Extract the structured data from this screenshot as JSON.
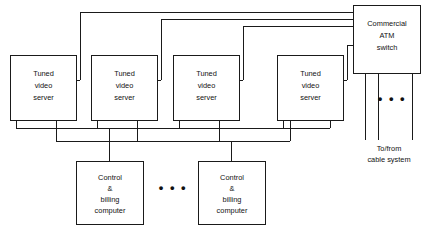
{
  "diagram": {
    "colors": {
      "background": "#ffffff",
      "stroke": "#1a1a1a",
      "text": "#111111"
    },
    "video_servers": [
      {
        "id": "video-server-1",
        "line1": "Tuned",
        "line2": "video",
        "line3": "server",
        "x": 10,
        "y": 55,
        "w": 66,
        "h": 65
      },
      {
        "id": "video-server-2",
        "line1": "Tuned",
        "line2": "video",
        "line3": "server",
        "x": 91,
        "y": 55,
        "w": 66,
        "h": 65
      },
      {
        "id": "video-server-3",
        "line1": "Tuned",
        "line2": "video",
        "line3": "server",
        "x": 173,
        "y": 55,
        "w": 66,
        "h": 65
      },
      {
        "id": "video-server-4",
        "line1": "Tuned",
        "line2": "video",
        "line3": "server",
        "x": 277,
        "y": 55,
        "w": 66,
        "h": 65
      }
    ],
    "atm_switch": {
      "id": "commercial-atm-switch",
      "line1": "Commercial",
      "line2": "ATM",
      "line3": "switch",
      "x": 353,
      "y": 5,
      "w": 67,
      "h": 68
    },
    "control_computers": [
      {
        "id": "control-billing-computer-1",
        "line1": "Control",
        "line2": "&",
        "line3": "billing",
        "line4": "computer",
        "x": 76,
        "y": 161,
        "w": 67,
        "h": 63
      },
      {
        "id": "control-billing-computer-2",
        "line1": "Control",
        "line2": "&",
        "line3": "billing",
        "line4": "computer",
        "x": 198,
        "y": 161,
        "w": 67,
        "h": 63
      }
    ],
    "ellipses": [
      {
        "id": "video-server-ellipsis",
        "text": "• • •",
        "x": 389,
        "y": 103
      },
      {
        "id": "control-computer-ellipsis",
        "text": "• • •",
        "x": 171,
        "y": 192
      }
    ],
    "captions": [
      {
        "id": "cable-system-caption",
        "line1": "To/from",
        "line2": "cable system",
        "x": 389,
        "y": 148
      }
    ]
  }
}
